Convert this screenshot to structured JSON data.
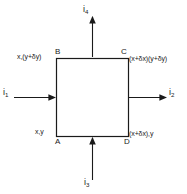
{
  "diagram": {
    "stroke_color": "#1a1a1a",
    "background_color": "#ffffff",
    "element": {
      "shape": "square",
      "vertices": [
        {
          "id": "A",
          "label": "A",
          "position": "bottom-left",
          "coordinate_label": "x,y"
        },
        {
          "id": "B",
          "label": "B",
          "position": "top-left",
          "coordinate_label": "x,(y+δy)"
        },
        {
          "id": "C",
          "label": "C",
          "position": "top-right",
          "coordinate_label": "(x+δx)(y+δy)"
        },
        {
          "id": "D",
          "label": "D",
          "position": "bottom-right",
          "coordinate_label": "(x+δx),y"
        }
      ]
    },
    "fluxes": [
      {
        "id": "i1",
        "symbol": "i",
        "subscript": "1",
        "direction": "right",
        "side": "left",
        "into_element": true
      },
      {
        "id": "i2",
        "symbol": "i",
        "subscript": "2",
        "direction": "right",
        "side": "right",
        "into_element": false
      },
      {
        "id": "i3",
        "symbol": "i",
        "subscript": "3",
        "direction": "up",
        "side": "bottom",
        "into_element": true
      },
      {
        "id": "i4",
        "symbol": "i",
        "subscript": "4",
        "direction": "up",
        "side": "top",
        "into_element": false
      }
    ]
  }
}
